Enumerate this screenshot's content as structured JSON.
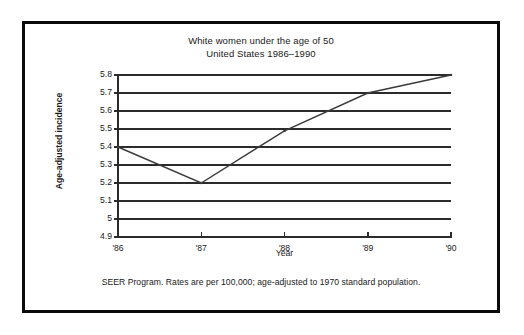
{
  "figure": {
    "title_lines": [
      "White women under the age of 50",
      "United States 1986–1990"
    ],
    "footnote": "SEER Program. Rates are per 100,000; age-adjusted to 1970 standard population.",
    "border_color": "#0a0a0a",
    "background_color": "#ffffff",
    "line_color": "#3a3a3a",
    "grid_color": "#2b2b2b"
  },
  "chart_data": {
    "type": "line",
    "subtitle": "United States 1986–1990",
    "xlabel": "Year",
    "ylabel": "Age-adjusted incidence",
    "categories": [
      "'86",
      "'87",
      "'88",
      "'89",
      "'90"
    ],
    "x": [
      1986,
      1987,
      1988,
      1989,
      1990
    ],
    "values": [
      5.4,
      5.2,
      5.49,
      5.7,
      5.8
    ],
    "series": [
      {
        "name": "Age-adjusted incidence",
        "values": [
          5.4,
          5.2,
          5.49,
          5.7,
          5.8
        ]
      }
    ],
    "ylim": [
      4.9,
      5.8
    ],
    "xlim": [
      "'86",
      "'90"
    ],
    "ytick_labels": [
      "5.8",
      "5.7",
      "5.6",
      "5.5",
      "5.4",
      "5.3",
      "5.2",
      "5.1",
      "5",
      "4.9"
    ],
    "ytick_values": [
      5.8,
      5.7,
      5.6,
      5.5,
      5.4,
      5.3,
      5.2,
      5.1,
      5.0,
      4.9
    ],
    "xtick_labels": [
      "'86",
      "'87",
      "'88",
      "'89",
      "'90"
    ],
    "grid": "horizontal",
    "legend": "none",
    "markers": true,
    "annotations": []
  }
}
